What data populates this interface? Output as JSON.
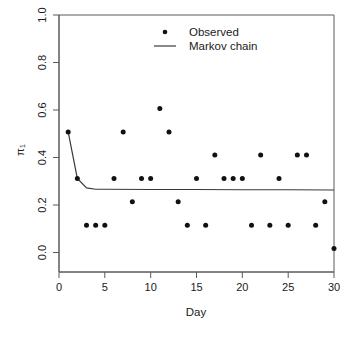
{
  "chart_data": {
    "type": "scatter",
    "title": "",
    "xlabel": "Day",
    "ylabel": "π₁",
    "xlim": [
      0,
      30
    ],
    "ylim": [
      0.0,
      1.0
    ],
    "xticks": [
      0,
      5,
      10,
      15,
      20,
      25,
      30
    ],
    "xtick_labels": [
      "0",
      "5",
      "10",
      "15",
      "20",
      "25",
      "30"
    ],
    "yticks": [
      0.0,
      0.2,
      0.4,
      0.6,
      0.8,
      1.0
    ],
    "ytick_labels": [
      "0.0",
      "0.2",
      "0.4",
      "0.6",
      "0.8",
      "1.0"
    ],
    "grid": false,
    "legend_position": "top-center",
    "legend": [
      {
        "label": "Observed",
        "marker": "point",
        "color": "#111111"
      },
      {
        "label": "Markov chain",
        "marker": "line",
        "color": "#3a3a3a"
      }
    ],
    "series": [
      {
        "name": "Observed",
        "type": "scatter",
        "x": [
          1,
          2,
          3,
          4,
          5,
          6,
          7,
          8,
          9,
          10,
          11,
          12,
          13,
          14,
          15,
          16,
          17,
          18,
          19,
          20,
          21,
          22,
          23,
          24,
          25,
          26,
          27,
          28,
          29,
          30
        ],
        "values": [
          0.545,
          0.364,
          0.182,
          0.182,
          0.182,
          0.364,
          0.545,
          0.273,
          0.364,
          0.364,
          0.636,
          0.545,
          0.273,
          0.182,
          0.364,
          0.182,
          0.455,
          0.364,
          0.364,
          0.364,
          0.182,
          0.455,
          0.182,
          0.364,
          0.182,
          0.455,
          0.455,
          0.182,
          0.273,
          0.091
        ]
      },
      {
        "name": "Markov chain",
        "type": "line",
        "x": [
          1,
          2,
          3,
          4,
          5,
          10,
          15,
          20,
          25,
          30
        ],
        "values": [
          0.545,
          0.364,
          0.327,
          0.322,
          0.322,
          0.321,
          0.321,
          0.32,
          0.32,
          0.319
        ]
      }
    ]
  },
  "axes": {
    "x_title": "Day",
    "y_title": "π₁"
  },
  "legend": {
    "observed_label": "Observed",
    "markov_label": "Markov chain"
  }
}
